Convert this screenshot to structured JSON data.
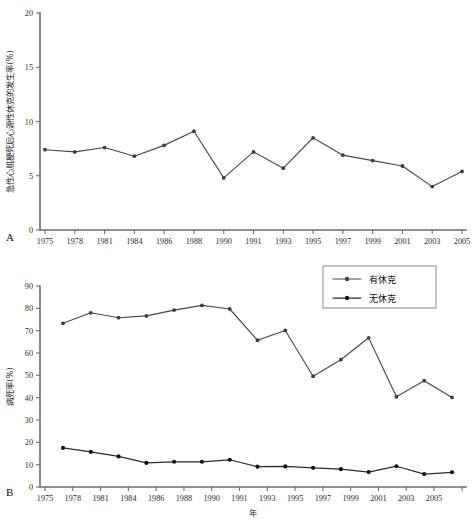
{
  "figure": {
    "panel_a_label": "A",
    "panel_b_label": "B"
  },
  "chart_data": [
    {
      "panel": "A",
      "type": "line",
      "title": "",
      "xlabel": "",
      "ylabel": "急性心肌梗死后心源性休克的发生率(%)",
      "ylim": [
        0,
        20
      ],
      "yticks": [
        0,
        5,
        10,
        15,
        20
      ],
      "yticklabels": [
        "0",
        "5",
        "10",
        "15",
        "20"
      ],
      "grid": false,
      "legend": "none",
      "categories": [
        "1975",
        "1978",
        "1981",
        "1984",
        "1986",
        "1988",
        "1990",
        "1991",
        "1993",
        "1995",
        "1997",
        "1999",
        "2001",
        "2003",
        "2005"
      ],
      "xticklabels": [
        "1975",
        "1978",
        "1981",
        "1984",
        "1986",
        "1988",
        "1990",
        "1991",
        "1993",
        "1995",
        "1997",
        "1999",
        "2001",
        "2003",
        "2005"
      ],
      "series": [
        {
          "name": "急性心肌梗死后心源性休克的发生率",
          "values": [
            7.4,
            7.2,
            7.6,
            6.8,
            7.8,
            9.1,
            4.8,
            7.2,
            5.7,
            8.5,
            6.9,
            6.4,
            5.9,
            4.0,
            5.4
          ]
        }
      ]
    },
    {
      "panel": "B",
      "type": "line",
      "title": "",
      "xlabel": "年",
      "ylabel": "病死率(%)",
      "ylim": [
        0,
        90
      ],
      "yticks": [
        0,
        10,
        20,
        30,
        40,
        50,
        60,
        70,
        80,
        90
      ],
      "yticklabels": [
        "0",
        "10",
        "20",
        "30",
        "40",
        "50",
        "60",
        "70",
        "80",
        "90"
      ],
      "grid": false,
      "legend": "top-right",
      "categories": [
        "1975",
        "1978",
        "1981",
        "1984",
        "1986",
        "1988",
        "1990",
        "1991",
        "1993",
        "1995",
        "1997",
        "1999",
        "2001",
        "2003",
        "2005"
      ],
      "xticklabels": [
        "1975",
        "1978",
        "1981",
        "1984",
        "1986",
        "1988",
        "1990",
        "1991",
        "1993",
        "1995",
        "1997",
        "1999",
        "2001",
        "2003",
        "2005"
      ],
      "series": [
        {
          "name": "有休克",
          "values": [
            73.3,
            78.0,
            75.8,
            76.6,
            79.2,
            81.3,
            79.7,
            65.7,
            70.1,
            49.6,
            57.0,
            66.8,
            40.4,
            47.6,
            40.1
          ]
        },
        {
          "name": "无休克",
          "values": [
            17.5,
            15.7,
            13.7,
            10.8,
            11.3,
            11.3,
            12.2,
            9.1,
            9.2,
            8.6,
            8.0,
            6.7,
            9.3,
            5.8,
            6.6
          ]
        }
      ]
    }
  ],
  "legend": {
    "items": [
      {
        "label": "有休克",
        "marker": "line-dot-marker",
        "color": "#4a4a4a"
      },
      {
        "label": "无休克",
        "marker": "line-dot-marker",
        "color": "#111111"
      }
    ]
  }
}
